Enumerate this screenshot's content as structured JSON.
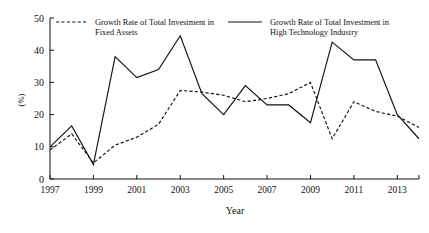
{
  "chart_data": {
    "type": "line",
    "title": "",
    "xlabel": "Year",
    "ylabel": "(%)",
    "xlim": [
      1997,
      2014
    ],
    "ylim": [
      0,
      50
    ],
    "grid": false,
    "legend_position": "top",
    "x": [
      1997,
      1998,
      1999,
      2000,
      2001,
      2002,
      2003,
      2004,
      2005,
      2006,
      2007,
      2008,
      2009,
      2010,
      2011,
      2012,
      2013,
      2014
    ],
    "xticks": [
      1997,
      1999,
      2001,
      2003,
      2005,
      2007,
      2009,
      2011,
      2013
    ],
    "xtick_labels": [
      "1997",
      "1999",
      "2001",
      "2003",
      "2005",
      "2007",
      "2009",
      "2011",
      "2013"
    ],
    "yticks": [
      0,
      10,
      20,
      30,
      40,
      50
    ],
    "ytick_labels": [
      "0",
      "10",
      "20",
      "30",
      "40",
      "50"
    ],
    "series": [
      {
        "name": "Growth Rate of Total Investment in Fixed Assets",
        "style": "dashed",
        "color": "#111111",
        "values": [
          9,
          14,
          5,
          10.5,
          13,
          17,
          27.5,
          27,
          26,
          24,
          25,
          26.5,
          30,
          12.5,
          24,
          21,
          19.5,
          16
        ]
      },
      {
        "name": "Growth Rate of Total Investment in High Technology Industry",
        "style": "solid",
        "color": "#111111",
        "values": [
          10,
          16.5,
          4.5,
          38,
          31.5,
          34,
          44.5,
          26.5,
          20,
          29,
          23,
          23,
          17.5,
          42.5,
          37,
          37,
          20,
          12.5
        ]
      }
    ]
  },
  "legend": {
    "entries": [
      {
        "line1": "Growth Rate of Total Investment in",
        "line2": "Fixed Assets",
        "style": "dashed"
      },
      {
        "line1": "Growth Rate of Total Investment in",
        "line2": "High Technology Industry",
        "style": "solid"
      }
    ]
  }
}
